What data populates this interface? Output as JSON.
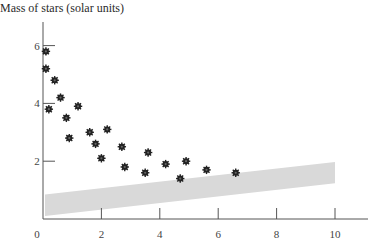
{
  "chart_data": {
    "type": "scatter",
    "title": "",
    "ylabel": "Mass of stars (solar units)",
    "xlabel": "",
    "xlim": [
      0,
      11.5
    ],
    "ylim": [
      0,
      7
    ],
    "x_ticks": [
      0,
      2,
      4,
      6,
      8,
      10
    ],
    "y_ticks": [
      2,
      4,
      6
    ],
    "grid": false,
    "legend": null,
    "series": [
      {
        "name": "stars",
        "marker": "star-burst",
        "color": "#222222",
        "points": [
          {
            "x": 0.1,
            "y": 5.8
          },
          {
            "x": 0.1,
            "y": 5.2
          },
          {
            "x": 0.4,
            "y": 4.8
          },
          {
            "x": 0.6,
            "y": 4.2
          },
          {
            "x": 0.2,
            "y": 3.8
          },
          {
            "x": 1.2,
            "y": 3.9
          },
          {
            "x": 0.8,
            "y": 3.5
          },
          {
            "x": 0.9,
            "y": 2.8
          },
          {
            "x": 1.6,
            "y": 3.0
          },
          {
            "x": 2.2,
            "y": 3.1
          },
          {
            "x": 1.8,
            "y": 2.6
          },
          {
            "x": 2.7,
            "y": 2.5
          },
          {
            "x": 2.0,
            "y": 2.1
          },
          {
            "x": 2.8,
            "y": 1.8
          },
          {
            "x": 3.6,
            "y": 2.3
          },
          {
            "x": 3.5,
            "y": 1.6
          },
          {
            "x": 4.2,
            "y": 1.9
          },
          {
            "x": 4.9,
            "y": 2.0
          },
          {
            "x": 4.7,
            "y": 1.4
          },
          {
            "x": 5.6,
            "y": 1.7
          },
          {
            "x": 6.6,
            "y": 1.6
          }
        ]
      }
    ],
    "band": {
      "name": "shaded band",
      "color": "#d9d9d9",
      "x": [
        0,
        10
      ],
      "upper": [
        0.85,
        1.97
      ],
      "lower": [
        0.1,
        1.24
      ]
    }
  }
}
